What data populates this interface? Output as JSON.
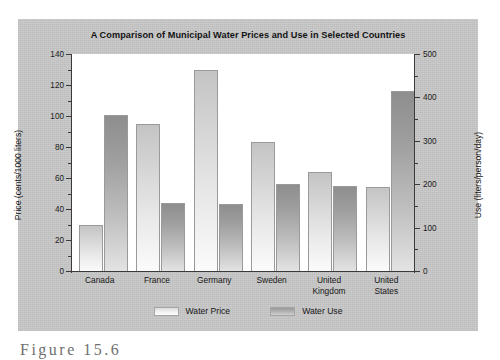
{
  "figure": {
    "caption": "Figure 15.6",
    "panel_color": "#c9c9c9",
    "plot_background": "#ffffff"
  },
  "chart_data": {
    "type": "bar",
    "title": "A Comparison of Municipal Water Prices and Use in Selected Countries",
    "categories": [
      "Canada",
      "France",
      "Germany",
      "Sweden",
      "United Kingdom",
      "United States"
    ],
    "category_lines": [
      [
        "Canada"
      ],
      [
        "France"
      ],
      [
        "Germany"
      ],
      [
        "Sweden"
      ],
      [
        "United",
        "Kingdom"
      ],
      [
        "United",
        "States"
      ]
    ],
    "series": [
      {
        "name": "Water Price",
        "axis": "left",
        "color": "#e8e8e8",
        "values": [
          30,
          95,
          130,
          83,
          64,
          54
        ]
      },
      {
        "name": "Water Use",
        "axis": "right",
        "color": "#a8a8a8",
        "values": [
          360,
          157,
          155,
          200,
          197,
          415
        ]
      }
    ],
    "xlabel": "",
    "ylabel": "Price (cents/1000 liters)",
    "y2label": "Use (liters/person/day)",
    "ylim": [
      0,
      140
    ],
    "y2lim": [
      0,
      500
    ],
    "yticks": [
      0,
      20,
      40,
      60,
      80,
      100,
      120,
      140
    ],
    "yticklabels": [
      "0",
      "20",
      "40",
      "60",
      "80",
      "100",
      "120",
      "140"
    ],
    "y2ticks": [
      0,
      100,
      200,
      300,
      400,
      500
    ],
    "y2ticklabels": [
      "0",
      "100",
      "200",
      "300",
      "400",
      "500"
    ],
    "y2_minor_ticks": [
      50,
      150,
      250,
      350,
      450
    ],
    "y_minor_ticks": [
      10,
      30,
      50,
      70,
      90,
      110,
      130
    ],
    "grid": false,
    "legend": {
      "position": "bottom",
      "entries": [
        {
          "label": "Water Price",
          "swatch": "price"
        },
        {
          "label": "Water Use",
          "swatch": "use"
        }
      ]
    }
  }
}
